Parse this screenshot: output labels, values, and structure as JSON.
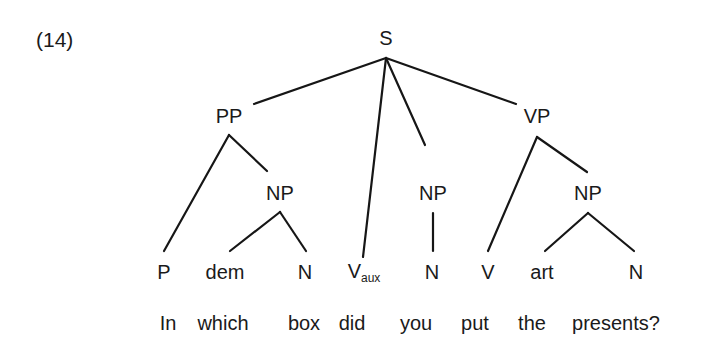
{
  "example_number": "(14)",
  "tree": {
    "root": {
      "label": "S",
      "x": 386,
      "y": 38
    },
    "phrases": [
      {
        "id": "pp",
        "label": "PP",
        "x": 229,
        "y": 116
      },
      {
        "id": "vp",
        "label": "VP",
        "x": 537,
        "y": 116
      },
      {
        "id": "np1",
        "label": "NP",
        "x": 280,
        "y": 193
      },
      {
        "id": "np2",
        "label": "NP",
        "x": 433,
        "y": 193
      },
      {
        "id": "np3",
        "label": "NP",
        "x": 588,
        "y": 193
      }
    ],
    "leaves": [
      {
        "label": "P",
        "x": 164
      },
      {
        "label": "dem",
        "x": 225
      },
      {
        "label": "N",
        "x": 305
      },
      {
        "label": "V",
        "sub": "aux",
        "x": 362
      },
      {
        "label": "N",
        "x": 432
      },
      {
        "label": "V",
        "x": 488
      },
      {
        "label": "art",
        "x": 542
      },
      {
        "label": "N",
        "x": 636
      }
    ],
    "leaf_y": 272
  },
  "sentence": {
    "words": [
      {
        "text": "In",
        "x": 168
      },
      {
        "text": "which",
        "x": 223
      },
      {
        "text": "box",
        "x": 304
      },
      {
        "text": "did",
        "x": 352
      },
      {
        "text": "you",
        "x": 416
      },
      {
        "text": "put",
        "x": 475
      },
      {
        "text": "the",
        "x": 532
      },
      {
        "text": "presents?",
        "x": 616
      }
    ],
    "y": 323
  }
}
